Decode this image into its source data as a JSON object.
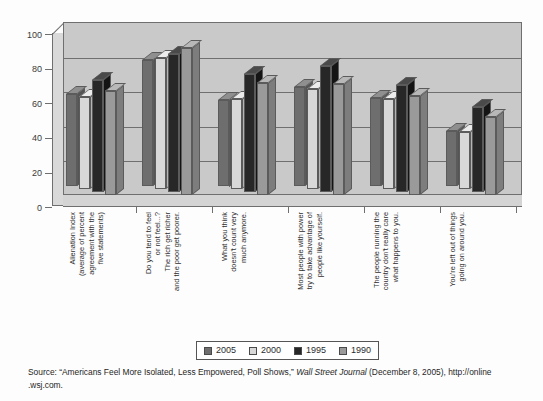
{
  "chart_data": {
    "type": "bar",
    "title": "",
    "xlabel": "",
    "ylabel": "",
    "ylim": [
      0,
      100
    ],
    "yticks": [
      0,
      20,
      40,
      60,
      80,
      100
    ],
    "grid": true,
    "legend_position": "bottom",
    "categories": [
      [
        "Alienation Index",
        "(average of percent",
        "agreement with the",
        "five statements)"
      ],
      [
        "Do you tend to feel",
        "or not feel...?",
        "The rich get richer",
        "and the poor get poorer."
      ],
      [
        "What you think",
        "doesn't count very",
        "much anymore."
      ],
      [
        "Most people with power",
        "try to take advantage of",
        "people like yourself."
      ],
      [
        "The people running the",
        "country don't really care",
        "what happens to you."
      ],
      [
        "You're left out of things",
        "going on around you."
      ]
    ],
    "series": [
      {
        "name": "2005",
        "color": "#6e6e6e",
        "values": [
          53,
          73,
          50,
          57,
          51,
          32
        ]
      },
      {
        "name": "2000",
        "color": "#d8d8d8",
        "values": [
          53,
          76,
          52,
          58,
          52,
          33
        ]
      },
      {
        "name": "1995",
        "color": "#272727",
        "values": [
          65,
          80,
          68,
          73,
          62,
          49
        ]
      },
      {
        "name": "1990",
        "color": "#9a9a9a",
        "values": [
          60,
          85,
          65,
          64,
          57,
          45
        ]
      }
    ]
  },
  "legend": {
    "items": [
      {
        "label": "2005"
      },
      {
        "label": "2000"
      },
      {
        "label": "1995"
      },
      {
        "label": "1990"
      }
    ]
  },
  "source": {
    "prefix": "Source: “Americans Feel More Isolated, Less Empowered, Poll Shows,” ",
    "publication": "Wall Street Journal",
    "suffix": " (December 8, 2005), http://online .wsj.com."
  }
}
